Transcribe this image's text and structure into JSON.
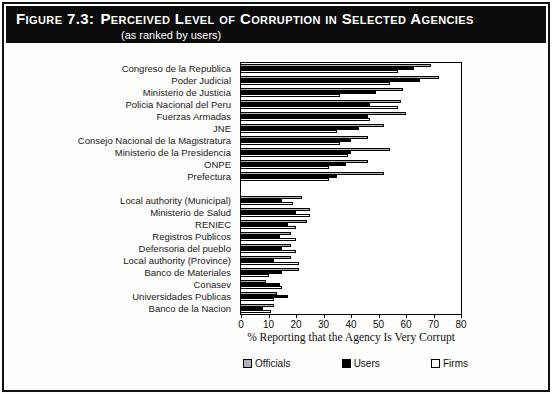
{
  "figure": {
    "label": "Figure 7.3:",
    "title": "Perceived Level of Corruption in Selected Agencies",
    "subtitle": "(as ranked by users)"
  },
  "chart_data": {
    "type": "bar",
    "orientation": "horizontal",
    "xlabel": "% Reporting that the Agency Is Very Corrupt",
    "xlim": [
      0,
      80
    ],
    "xticks": [
      0,
      10,
      20,
      30,
      40,
      50,
      60,
      70,
      80
    ],
    "legend_position": "bottom",
    "grid": false,
    "group_gap_after_index": 9,
    "categories": [
      "Congreso de la Republica",
      "Poder Judicial",
      "Ministerio de Justicia",
      "Policia Nacional del Peru",
      "Fuerzas Armadas",
      "JNE",
      "Consejo Nacional de la Magistratura",
      "Ministerio de la Presidencia",
      "ONPE",
      "Prefectura",
      "Local authority (Municipal)",
      "Ministerio de Salud",
      "RENIEC",
      "Registros Publicos",
      "Defensoria del pueblo",
      "Local authority (Province)",
      "Banco de Materiales",
      "Conasev",
      "Universidades Publicas",
      "Banco de la Nacion"
    ],
    "series": [
      {
        "name": "Officials",
        "color": "#b3b3b3",
        "values": [
          69,
          72,
          59,
          58,
          60,
          52,
          46,
          54,
          46,
          52,
          22,
          25,
          24,
          18,
          18,
          18,
          21,
          9,
          13,
          12
        ]
      },
      {
        "name": "Users",
        "color": "#000000",
        "values": [
          63,
          65,
          49,
          47,
          46,
          43,
          40,
          40,
          38,
          35,
          15,
          20,
          17,
          14,
          15,
          12,
          15,
          14,
          17,
          8
        ]
      },
      {
        "name": "Firms",
        "color": "#ffffff",
        "values": [
          57,
          54,
          36,
          57,
          47,
          35,
          36,
          39,
          32,
          32,
          19,
          25,
          20,
          20,
          20,
          21,
          10,
          15,
          12,
          11
        ]
      }
    ]
  }
}
